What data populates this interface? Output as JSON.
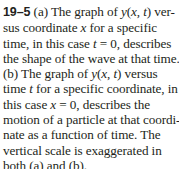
{
  "caption": {
    "figure_label": "19–5",
    "lines": [
      {
        "parts": [
          " (a) The graph of ",
          "y",
          "(",
          "x",
          ", ",
          "t",
          ") ver-"
        ]
      },
      {
        "parts": [
          "sus coordinate ",
          "x",
          " for a specific"
        ]
      },
      {
        "parts": [
          "time, in this case ",
          "t",
          " = 0, describes"
        ]
      },
      {
        "parts": [
          "the shape of the wave at that time."
        ]
      },
      {
        "parts": [
          "(b) The graph of ",
          "y",
          "(",
          "x",
          ", ",
          "t",
          ") versus"
        ]
      },
      {
        "parts": [
          "time ",
          "t",
          " for a specific coordinate, in"
        ]
      },
      {
        "parts": [
          "this case ",
          "x",
          " = 0, describes the"
        ]
      },
      {
        "parts": [
          "motion of a particle at that coordi-"
        ]
      },
      {
        "parts": [
          "nate as a function of time. The"
        ]
      },
      {
        "parts": [
          "vertical scale is exaggerated in"
        ]
      },
      {
        "parts": [
          "both (a) and (b)."
        ]
      }
    ]
  }
}
